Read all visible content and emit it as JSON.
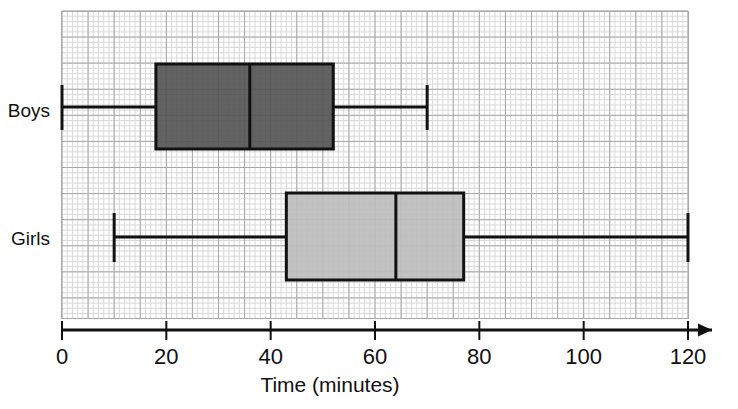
{
  "chart_data": {
    "type": "box",
    "title": "",
    "xlabel": "Time (minutes)",
    "ylabel": "",
    "xlim": [
      0,
      120
    ],
    "xticks": [
      0,
      20,
      40,
      60,
      80,
      100,
      120
    ],
    "xtick_labels": [
      "0",
      "20",
      "40",
      "60",
      "80",
      "100",
      "120"
    ],
    "minor_grid_step": 1,
    "major_grid_step": 5,
    "grid": true,
    "legend": "none",
    "categories": [
      "Boys",
      "Girls"
    ],
    "series": [
      {
        "name": "Boys",
        "min": 0,
        "q1": 18,
        "median": 36,
        "q3": 52,
        "max": 70,
        "iqr": 34,
        "range": 70,
        "fill_color": "#555555"
      },
      {
        "name": "Girls",
        "min": 10,
        "q1": 43,
        "median": 64,
        "q3": 77,
        "max": 120,
        "iqr": 34,
        "range": 110,
        "fill_color": "#bdbdbd"
      }
    ]
  },
  "axis": {
    "x_title": "Time (minutes)",
    "tick_labels": [
      "0",
      "20",
      "40",
      "60",
      "80",
      "100",
      "120"
    ],
    "arrow": "right-arrow-icon"
  },
  "category_labels": {
    "boys": "Boys",
    "girls": "Girls"
  },
  "colors": {
    "boys_fill": "#555555",
    "girls_fill": "#bdbdbd",
    "stroke": "#111111",
    "grid_minor": "#d9d9d9",
    "grid_major": "#a8a8a8",
    "background": "#ffffff"
  }
}
